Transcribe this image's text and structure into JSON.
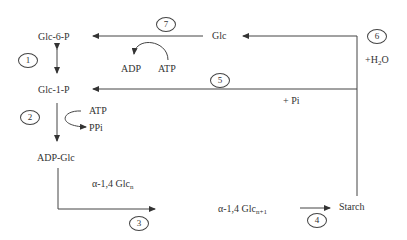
{
  "diagram": {
    "type": "starch metabolism pathway",
    "nodes": {
      "glc6p": "Glc-6-P",
      "glc1p": "Glc-1-P",
      "adpglc": "ADP-Glc",
      "glc": "Glc",
      "glcn_base": "α-1,4 Glc",
      "glcn_sub": "n",
      "glcn1_base": "α-1,4 Glc",
      "glcn1_sub": "n+1",
      "starch": "Starch"
    },
    "cofactors": {
      "adp_7": "ADP",
      "atp_7": "ATP",
      "atp_2": "ATP",
      "ppi_2": "PPi",
      "pi_5": "+ Pi",
      "h2o_6_prefix": "+H",
      "h2o_6_sub": "2",
      "h2o_6_suffix": "O"
    },
    "steps": [
      "1",
      "2",
      "3",
      "4",
      "5",
      "6",
      "7"
    ],
    "edges": [
      {
        "from": "Glc-6-P",
        "to": "Glc-1-P",
        "step": "1",
        "bidirectional": true
      },
      {
        "from": "Glc-1-P",
        "to": "ADP-Glc",
        "step": "2",
        "cofactors": [
          "ATP",
          "PPi"
        ]
      },
      {
        "from": "ADP-Glc",
        "to": "α-1,4 Glc n+1",
        "step": "3",
        "with": "α-1,4 Glc n"
      },
      {
        "from": "α-1,4 Glc n+1",
        "to": "Starch",
        "step": "4"
      },
      {
        "from": "Starch",
        "to": "Glc-1-P",
        "step": "5",
        "cofactors": [
          "+ Pi"
        ]
      },
      {
        "from": "Starch",
        "to": "Glc",
        "step": "6",
        "cofactors": [
          "+H2O"
        ]
      },
      {
        "from": "Glc",
        "to": "Glc-6-P",
        "step": "7",
        "cofactors": [
          "ATP",
          "ADP"
        ]
      }
    ],
    "colors": {
      "line": "#333333",
      "text": "#333333",
      "background": "#ffffff"
    }
  }
}
